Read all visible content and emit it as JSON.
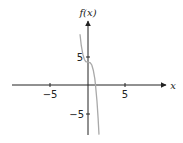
{
  "chart_data": {
    "type": "line",
    "title": "",
    "xlabel": "x",
    "ylabel": "f(x)",
    "xlim": [
      -11.7,
      12.2
    ],
    "ylim": [
      -10,
      15
    ],
    "grid": false,
    "legend": null,
    "x_ticks": [
      -5,
      5
    ],
    "x_tick_labels": [
      "−5",
      "5"
    ],
    "y_ticks": [
      -5,
      5
    ],
    "y_tick_labels": [
      "−5",
      "5"
    ],
    "series": [
      {
        "name": "f(x) = -4x^3 + 4",
        "color": "#a9a9a9",
        "x": [
          -1.07,
          -0.9,
          -0.7,
          -0.5,
          -0.3,
          0,
          0.3,
          0.5,
          0.7,
          0.9,
          1.0,
          1.2,
          1.35,
          1.47
        ],
        "y": [
          8.9,
          6.9,
          5.4,
          4.5,
          4.1,
          4.0,
          3.9,
          3.5,
          2.6,
          1.1,
          0,
          -2.9,
          -5.8,
          -8.7
        ]
      }
    ]
  },
  "labels": {
    "x_axis": "x",
    "y_axis": "f(x)",
    "x_tick_neg": "−5",
    "x_tick_pos": "5",
    "y_tick_pos": "5",
    "y_tick_neg": "−5"
  },
  "colors": {
    "axis": "#222222",
    "curve": "#a9a9a9"
  }
}
